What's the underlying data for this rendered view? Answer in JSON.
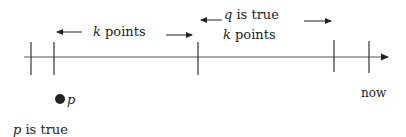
{
  "diagram": {
    "timeline": {
      "label_end": "now",
      "ticks_x": [
        31,
        54,
        198,
        334,
        368
      ]
    },
    "labels": {
      "k_points_left": {
        "var": "k",
        "text": " points"
      },
      "q_true": {
        "var": "q",
        "text": " is true"
      },
      "k_points_right": {
        "var": "k",
        "text": " points"
      },
      "dot_label": "p",
      "p_true": {
        "var": "p",
        "text": " is true"
      },
      "now": "now"
    }
  }
}
